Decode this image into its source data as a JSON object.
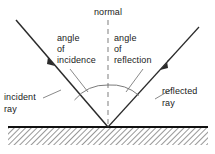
{
  "diagram": {
    "colors": {
      "ink": "#1a1a1a",
      "ray": "#2b2b2b",
      "normal_dash": "#8a8a8a",
      "arc": "#6b6b6b",
      "leader": "#6b6b6b",
      "surface": "#111111",
      "hatch": "#7d7d7d",
      "background": "#ffffff"
    },
    "labels": {
      "normal": "normal",
      "angle_of_incidence_line1": "angle",
      "angle_of_incidence_line2": "of",
      "angle_of_incidence_line3": "incidence",
      "angle_of_reflection_line1": "angle",
      "angle_of_reflection_line2": "of",
      "angle_of_reflection_line3": "reflection",
      "incident_ray_line1": "incident",
      "incident_ray_line2": "ray",
      "reflected_ray_line1": "reflected",
      "reflected_ray_line2": "ray"
    },
    "geometry": {
      "vertex_x": 108,
      "vertex_y": 127,
      "normal_top_y": 20,
      "incident_start_x": 16,
      "incident_start_y": 20,
      "reflected_end_x": 199,
      "reflected_end_y": 27,
      "surface_y": 127,
      "surface_left_x": 8,
      "surface_right_x": 208,
      "hatch_depth": 17
    }
  }
}
